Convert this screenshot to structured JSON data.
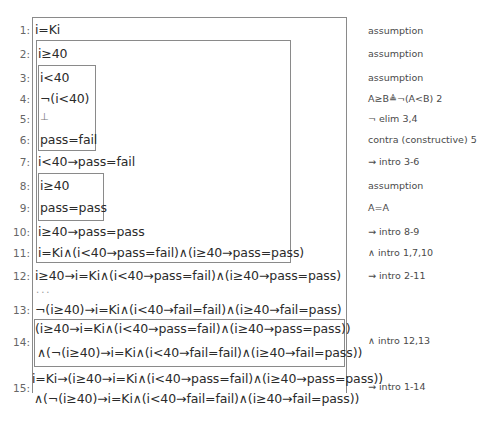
{
  "proof": {
    "lines": [
      {
        "num": "1:",
        "formula": "i=Ki",
        "justification": "assumption"
      },
      {
        "num": "2:",
        "formula": "i≥40",
        "justification": "assumption"
      },
      {
        "num": "3:",
        "formula": "i<40",
        "justification": "assumption"
      },
      {
        "num": "4:",
        "formula": "¬(i<40)",
        "justification": "A≥B≜¬(A<B) 2"
      },
      {
        "num": "5:",
        "formula": "⊥",
        "justification": "¬ elim 3,4"
      },
      {
        "num": "6:",
        "formula": "pass=fail",
        "justification": "contra (constructive) 5"
      },
      {
        "num": "7:",
        "formula": "i<40→pass=fail",
        "justification": "→ intro 3-6"
      },
      {
        "num": "8:",
        "formula": "i≥40",
        "justification": "assumption"
      },
      {
        "num": "9:",
        "formula": "pass=pass",
        "justification": "A=A"
      },
      {
        "num": "10:",
        "formula": "i≥40→pass=pass",
        "justification": "→ intro 8-9"
      },
      {
        "num": "11:",
        "formula": "i=Ki∧(i<40→pass=fail)∧(i≥40→pass=pass)",
        "justification": "∧ intro 1,7,10"
      },
      {
        "num": "12:",
        "formula": "i≥40→i=Ki∧(i<40→pass=fail)∧(i≥40→pass=pass)",
        "justification": "→ intro 2-11"
      },
      {
        "num": "13:",
        "formula": "¬(i≥40)→i=Ki∧(i<40→fail=fail)∧(i≥40→fail=pass)",
        "justification": ""
      },
      {
        "num": "14:",
        "formula": "(i≥40→i=Ki∧(i<40→pass=fail)∧(i≥40→pass=pass))",
        "formula2": "∧(¬(i≥40)→i=Ki∧(i<40→fail=fail)∧(i≥40→fail=pass))",
        "justification": "∧ intro 12,13"
      },
      {
        "num": "15:",
        "formula": "i=Ki→(i≥40→i=Ki∧(i<40→pass=fail)∧(i≥40→pass=pass))",
        "formula2": "∧(¬(i≥40)→i=Ki∧(i<40→fail=fail)∧(i≥40→fail=pass))",
        "justification": "→ intro 1-14"
      }
    ],
    "ellipsis": "..."
  }
}
